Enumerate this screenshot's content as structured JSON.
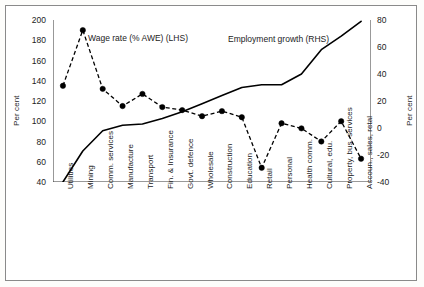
{
  "figure": {
    "background": "#ffffff",
    "frame_color": "#8a8a8a"
  },
  "axes": {
    "left": {
      "title": "Per cent",
      "ticks": [
        "40",
        "60",
        "80",
        "100",
        "120",
        "140",
        "160",
        "180",
        "200"
      ],
      "min": 40,
      "max": 200,
      "step": 20
    },
    "right": {
      "title": "Per cent",
      "ticks": [
        "-40",
        "-20",
        "0",
        "20",
        "40",
        "60",
        "80"
      ],
      "min": -40,
      "max": 80,
      "step": 20
    }
  },
  "annotations": {
    "wage": "Wage rate (% AWE) (LHS)",
    "employment": "Employment growth (RHS)"
  },
  "chart_data": {
    "type": "line",
    "title": "",
    "xlabel": "",
    "ylabel": "Per cent",
    "ylim": [
      40,
      200
    ],
    "y2lim": [
      -40,
      80
    ],
    "grid": false,
    "legend_position": "inline-annotation",
    "categories": [
      "Utilities",
      "Mining",
      "Comm. services",
      "Manufacture",
      "Transport",
      "Fin. & Insurance",
      "Govt. defence",
      "Wholesale",
      "Construction",
      "Education",
      "Retail",
      "Personal",
      "Health comm.",
      "Cultural, edu.",
      "Property, bus. services",
      "Accoun., sales, retal"
    ],
    "series": [
      {
        "name": "Wage rate (% AWE) (LHS)",
        "axis": "left",
        "style": "dashed",
        "marker": "circle",
        "color": "#000000",
        "values": [
          135,
          190,
          132,
          115,
          127,
          114,
          111,
          105,
          110,
          104,
          54,
          98,
          93,
          80,
          100,
          63
        ]
      },
      {
        "name": "Employment growth (RHS)",
        "axis": "right",
        "style": "solid",
        "marker": "none",
        "color": "#000000",
        "values": [
          -40,
          -17,
          -2,
          2,
          3,
          7,
          12,
          18,
          24,
          30,
          32,
          32,
          40,
          58,
          68,
          79
        ]
      }
    ]
  }
}
